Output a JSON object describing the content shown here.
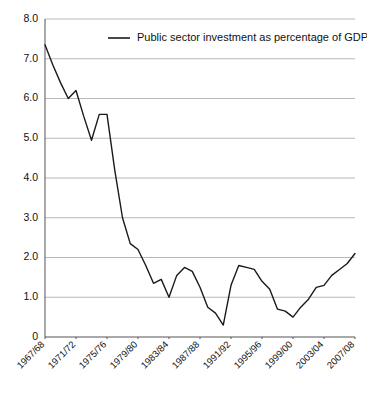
{
  "chart_data": {
    "type": "line",
    "title": "",
    "subtitle": "",
    "xlabel": "",
    "ylabel": "",
    "ylim": [
      0,
      8.0
    ],
    "y_ticks": [
      "0",
      "1.0",
      "2.0",
      "3.0",
      "4.0",
      "5.0",
      "6.0",
      "7.0",
      "8.0"
    ],
    "y_tick_values": [
      0,
      1.0,
      2.0,
      3.0,
      4.0,
      5.0,
      6.0,
      7.0,
      8.0
    ],
    "grid": "horizontal",
    "legend_position": "top-center",
    "legend": [
      "Public sector investment as percentage of GDP"
    ],
    "line_color": "#1a1a1a",
    "grid_color": "#b8b8b8",
    "axis_color": "#555555",
    "x_tick_labels": [
      "1967/68",
      "1971/72",
      "1975/76",
      "1979/80",
      "1983/84",
      "1987/88",
      "1991/92",
      "1995/96",
      "1999/00",
      "2003/04",
      "2007/08"
    ],
    "x_tick_indices": [
      0,
      4,
      8,
      12,
      16,
      20,
      24,
      28,
      32,
      36,
      40
    ],
    "categories": [
      "1967/68",
      "1968/69",
      "1969/70",
      "1970/71",
      "1971/72",
      "1972/73",
      "1973/74",
      "1974/75",
      "1975/76",
      "1976/77",
      "1977/78",
      "1978/79",
      "1979/80",
      "1980/81",
      "1981/82",
      "1982/83",
      "1983/84",
      "1984/85",
      "1985/86",
      "1986/87",
      "1987/88",
      "1988/89",
      "1989/90",
      "1990/91",
      "1991/92",
      "1992/93",
      "1993/94",
      "1994/95",
      "1995/96",
      "1996/97",
      "1997/98",
      "1998/99",
      "1999/00",
      "2000/01",
      "2001/02",
      "2002/03",
      "2003/04",
      "2004/05",
      "2005/06",
      "2006/07",
      "2007/08"
    ],
    "series": [
      {
        "name": "Public sector investment as percentage of GDP",
        "values": [
          7.35,
          6.85,
          6.4,
          6.0,
          6.2,
          5.55,
          4.95,
          5.6,
          5.6,
          4.2,
          3.0,
          2.35,
          2.2,
          1.8,
          1.35,
          1.45,
          1.0,
          1.55,
          1.75,
          1.65,
          1.25,
          0.75,
          0.6,
          0.3,
          1.3,
          1.8,
          1.75,
          1.7,
          1.4,
          1.2,
          0.7,
          0.65,
          0.5,
          0.75,
          0.95,
          1.25,
          1.3,
          1.55,
          1.7,
          1.85,
          2.1
        ]
      }
    ]
  },
  "legend": {
    "marker": "line-sample",
    "label": "Public sector investment as percentage of GDP"
  },
  "axes": {
    "y_label_0": "0",
    "y_label_1": "1.0",
    "y_label_2": "2.0",
    "y_label_3": "3.0",
    "y_label_4": "4.0",
    "y_label_5": "5.0",
    "y_label_6": "6.0",
    "y_label_7": "7.0",
    "y_label_8": "8.0"
  }
}
